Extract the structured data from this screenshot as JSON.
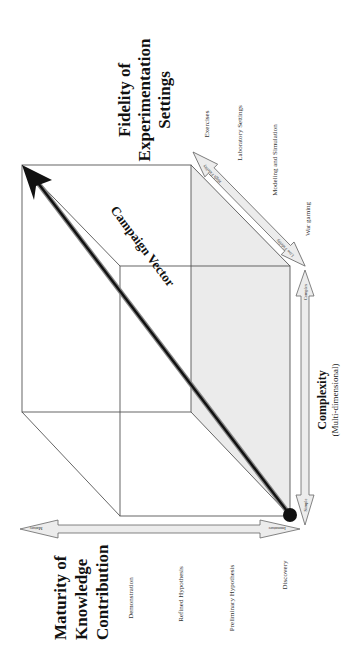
{
  "diagram": {
    "title_maturity": [
      "Maturity of",
      "Knowledge",
      "Contribution"
    ],
    "title_fidelity": [
      "Fidelity of",
      "Experimentation",
      "Settings"
    ],
    "title_complexity": "Complexity",
    "subtitle_complexity": "(Multi-dimensional)",
    "campaign_vector_label": "Campaign Vector",
    "maturity_levels": [
      "Demonstration",
      "Refined Hypothesis",
      "Preliminary Hypothesis",
      "Discovery"
    ],
    "maturity_arrow": {
      "high_label": "Mature",
      "low_label": "Immature"
    },
    "fidelity_levels": [
      "Exercises",
      "Laboratory Settings",
      "Modeling and Simulation",
      "War gaming"
    ],
    "fidelity_arrow": {
      "high_label": "High Fidelity",
      "low_label": "Low Fidelity"
    },
    "complexity_arrow": {
      "high_label": "Complex",
      "low_label": "Simple"
    },
    "colors": {
      "shaded_face": "#ebebeb",
      "edge": "#555555",
      "vector": "#111111",
      "arrow_fill": "#ececec"
    }
  }
}
